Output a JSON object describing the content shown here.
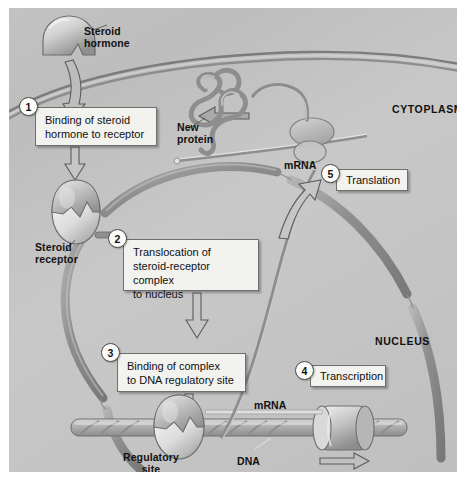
{
  "figure": {
    "background_color": "#c4c4c4",
    "border_color": "#ffffff"
  },
  "compartments": [
    {
      "id": "cytoplasm",
      "label": "CYTOPLASM",
      "x": 383,
      "y": 96
    },
    {
      "id": "nucleus",
      "label": "NUCLEUS",
      "x": 366,
      "y": 328
    }
  ],
  "structure_labels": [
    {
      "id": "steroid-hormone",
      "label": "Steroid\nhormone",
      "x": 75,
      "y": 18
    },
    {
      "id": "new-protein",
      "label": "New\nprotein",
      "x": 168,
      "y": 114
    },
    {
      "id": "steroid-receptor",
      "label": "Steroid\nreceptor",
      "x": 26,
      "y": 234
    },
    {
      "id": "mrna-cytoplasm",
      "label": "mRNA",
      "x": 275,
      "y": 152
    },
    {
      "id": "mrna-nucleus",
      "label": "mRNA",
      "x": 245,
      "y": 392
    },
    {
      "id": "regulatory-site",
      "label": "Regulatory\nsite",
      "x": 114,
      "y": 444
    },
    {
      "id": "dna",
      "label": "DNA",
      "x": 228,
      "y": 448
    }
  ],
  "steps": [
    {
      "number": "1",
      "name": "binding-of-steroid-hormone-to-receptor",
      "text": "Binding of steroid\nhormone to receptor",
      "circle": {
        "x": 10,
        "y": 89
      },
      "box": {
        "x": 26,
        "y": 99,
        "w": 122,
        "h": 39
      }
    },
    {
      "number": "2",
      "name": "translocation-of-steroid-receptor-complex-to-nucleus",
      "text": "Translocation of\nsteroid-receptor complex\nto nucleus",
      "circle": {
        "x": 99,
        "y": 221
      },
      "box": {
        "x": 114,
        "y": 231,
        "w": 136,
        "h": 52
      }
    },
    {
      "number": "3",
      "name": "binding-of-complex-to-dna-regulatory-site",
      "text": "Binding of complex\nto DNA regulatory site",
      "circle": {
        "x": 92,
        "y": 335
      },
      "box": {
        "x": 108,
        "y": 345,
        "w": 129,
        "h": 39
      }
    },
    {
      "number": "4",
      "name": "transcription",
      "text": "Transcription",
      "circle": {
        "x": 286,
        "y": 353
      },
      "box": {
        "x": 301,
        "y": 357,
        "w": 76,
        "h": 22
      }
    },
    {
      "number": "5",
      "name": "translation",
      "text": "Translation",
      "circle": {
        "x": 312,
        "y": 156
      },
      "box": {
        "x": 327,
        "y": 161,
        "w": 72,
        "h": 22
      }
    }
  ],
  "colors": {
    "membrane": "#8d8d8d",
    "nuclear_envelope": "#9a9a9a",
    "dna": "#a9a9a9",
    "protein": "#9b9b9b",
    "arrow_outline": "#5c5c5c",
    "text": "#111111",
    "callout_fill": "#f2f2ef"
  }
}
